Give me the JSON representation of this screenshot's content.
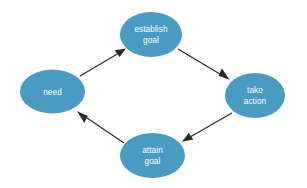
{
  "diagram": {
    "background_color": "#ffffff",
    "node_fill_color": "#4a9bc4",
    "node_text_color": "#ffffff",
    "edge_color": "#2b2b2b",
    "nodes": [
      {
        "id": "need",
        "label": "need",
        "lines": [
          "need"
        ],
        "cx": 52.5,
        "cy": 91.5,
        "rx": 32.5,
        "ry": 22.0
      },
      {
        "id": "establish-goal",
        "label": "establish goal",
        "lines": [
          "establish",
          "goal"
        ],
        "cx": 151.0,
        "cy": 34.5,
        "rx": 31.0,
        "ry": 22.5
      },
      {
        "id": "take-action",
        "label": "take action",
        "lines": [
          "take",
          "action"
        ],
        "cx": 255.0,
        "cy": 95.5,
        "rx": 30.0,
        "ry": 22.5
      },
      {
        "id": "attain-goal",
        "label": "attain goal",
        "lines": [
          "attain",
          "goal"
        ],
        "cx": 152.5,
        "cy": 155.5,
        "rx": 32.5,
        "ry": 22.5
      }
    ],
    "edges": [
      {
        "id": "need-to-establish-goal",
        "from": "need",
        "to": "establish-goal",
        "label": "",
        "x1": 80.0,
        "y1": 76.0,
        "x2": 124.0,
        "y2": 50.0,
        "direction": "up-right"
      },
      {
        "id": "establish-goal-to-take-action",
        "from": "establish-goal",
        "to": "take-action",
        "label": "",
        "x1": 178.0,
        "y1": 49.0,
        "x2": 228.0,
        "y2": 79.0,
        "direction": "down-right"
      },
      {
        "id": "take-action-to-attain-goal",
        "from": "take-action",
        "to": "attain-goal",
        "label": "",
        "x1": 232.0,
        "y1": 113.0,
        "x2": 183.0,
        "y2": 141.0,
        "direction": "down-left"
      },
      {
        "id": "attain-goal-to-need",
        "from": "attain-goal",
        "to": "need",
        "label": "",
        "x1": 124.0,
        "y1": 143.0,
        "x2": 78.0,
        "y2": 112.0,
        "direction": "up-left"
      }
    ]
  }
}
